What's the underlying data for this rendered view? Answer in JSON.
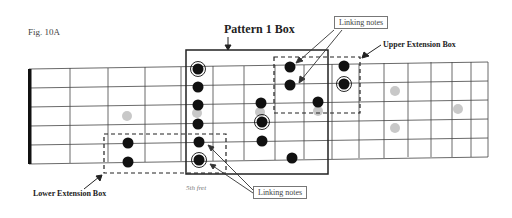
{
  "figure": {
    "label": "Fig. 10A",
    "title": "Pattern 1 Box",
    "upper_box_label": "Upper Extension Box",
    "lower_box_label": "Lower Extension Box",
    "fret_marker_label": "5th fret",
    "callouts": {
      "top": "Linking notes",
      "bottom": "Linking notes"
    }
  },
  "fretboard": {
    "strings": 6,
    "frets_visible": 12,
    "colors": {
      "line": "#333333",
      "note": "#111111",
      "inlay": "#c8c8c8",
      "nut": "#111111"
    }
  },
  "notes": [
    {
      "string": 1,
      "fret": 5,
      "root": true
    },
    {
      "string": 2,
      "fret": 5
    },
    {
      "string": 3,
      "fret": 5
    },
    {
      "string": 4,
      "fret": 5
    },
    {
      "string": 5,
      "fret": 5
    },
    {
      "string": 6,
      "fret": 5,
      "root": true
    },
    {
      "string": 3,
      "fret": 7
    },
    {
      "string": 4,
      "fret": 7,
      "root": true
    },
    {
      "string": 5,
      "fret": 7
    },
    {
      "string": 1,
      "fret": 8
    },
    {
      "string": 2,
      "fret": 8
    },
    {
      "string": 3,
      "fret": 9
    },
    {
      "string": 6,
      "fret": 8
    },
    {
      "string": 1,
      "fret": 10
    },
    {
      "string": 2,
      "fret": 10,
      "root": true
    },
    {
      "string": 5,
      "fret": 3
    },
    {
      "string": 6,
      "fret": 3
    }
  ],
  "inlays": [
    {
      "fret": 3,
      "position": "middle"
    },
    {
      "fret": 5,
      "position": "middle"
    },
    {
      "fret": 9,
      "position": "middle"
    },
    {
      "fret": 12,
      "position": "double"
    },
    {
      "fret": 15,
      "position": "middle"
    }
  ]
}
